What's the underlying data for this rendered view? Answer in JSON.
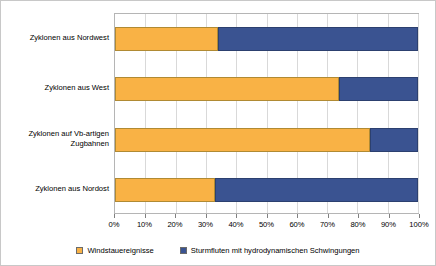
{
  "chart_data": {
    "type": "bar",
    "orientation": "horizontal",
    "stacked": true,
    "stack_total": 100,
    "title": "",
    "subtitle": "",
    "xlabel": "",
    "ylabel": "",
    "xlim": [
      0,
      100
    ],
    "grid": true,
    "legend_position": "bottom",
    "categories": [
      "Zyklonen aus Nordwest",
      "Zyklonen aus West",
      "Zyklonen auf Vb-artigen Zugbahnen",
      "Zyklonen aus Nordost"
    ],
    "tick_labels": [
      "0%",
      "10%",
      "20%",
      "30%",
      "40%",
      "50%",
      "60%",
      "70%",
      "80%",
      "90%",
      "100%"
    ],
    "tick_values": [
      0,
      10,
      20,
      30,
      40,
      50,
      60,
      70,
      80,
      90,
      100
    ],
    "series": [
      {
        "name": "Windstauereignisse",
        "color": "#F9B245",
        "values": [
          34,
          74,
          84,
          33
        ]
      },
      {
        "name": "Sturmfluten mit hydrodynamischen Schwingungen",
        "color": "#3A5391",
        "values": [
          66,
          26,
          16,
          67
        ]
      }
    ]
  }
}
